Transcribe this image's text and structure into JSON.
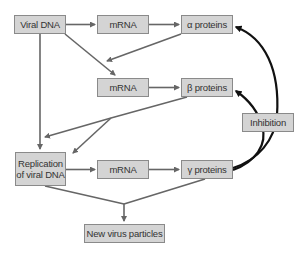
{
  "diagram": {
    "nodes": {
      "viral_dna": {
        "label": "Viral DNA"
      },
      "mrna_1": {
        "label": "mRNA"
      },
      "alpha_proteins": {
        "label": "α proteins"
      },
      "mrna_2": {
        "label": "mRNA"
      },
      "beta_proteins": {
        "label": "β proteins"
      },
      "inhibition": {
        "label": "Inhibition"
      },
      "replication": {
        "label_line1": "Replication",
        "label_line2": "of viral DNA"
      },
      "mrna_3": {
        "label": "mRNA"
      },
      "gamma_proteins": {
        "label": "γ proteins"
      },
      "new_virus": {
        "label": "New virus particles"
      }
    },
    "edges": [
      {
        "from": "viral_dna",
        "to": "mrna_1"
      },
      {
        "from": "mrna_1",
        "to": "alpha_proteins"
      },
      {
        "from": "viral_dna",
        "to": "mrna_2"
      },
      {
        "from": "alpha_proteins",
        "to": "mrna_2"
      },
      {
        "from": "mrna_2",
        "to": "beta_proteins"
      },
      {
        "from": "viral_dna",
        "to": "replication"
      },
      {
        "from": "beta_proteins",
        "to": "replication"
      },
      {
        "from": "replication",
        "to": "mrna_3"
      },
      {
        "from": "mrna_3",
        "to": "gamma_proteins"
      },
      {
        "from": "replication",
        "to": "new_virus"
      },
      {
        "from": "gamma_proteins",
        "to": "new_virus"
      },
      {
        "from": "gamma_proteins",
        "to": "alpha_proteins",
        "type": "inhibition"
      },
      {
        "from": "gamma_proteins",
        "to": "beta_proteins",
        "type": "inhibition"
      }
    ],
    "colors": {
      "box_fill": "#d4d4d4",
      "box_border": "#8a8a8a",
      "arrow_gray": "#666666",
      "inhibition_curve": "#111111"
    }
  }
}
